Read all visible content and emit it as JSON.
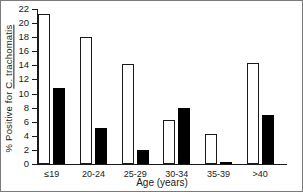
{
  "chart_data": {
    "type": "bar",
    "title": "",
    "xlabel": "Age (years)",
    "ylabel": "% Positive for C. trachomatis",
    "ylabel_plain": "% Positive for ",
    "ylabel_italic": "C. trachomatis",
    "categories": [
      "≤19",
      "20-24",
      "25-29",
      "30-34",
      "35-39",
      ">40"
    ],
    "series": [
      {
        "name": "open",
        "style": "open",
        "color": "#ffffff",
        "edge_color": "#000000",
        "values": [
          21.3,
          18.0,
          14.2,
          6.2,
          4.2,
          14.3
        ]
      },
      {
        "name": "filled",
        "style": "filled",
        "color": "#000000",
        "edge_color": "#000000",
        "values": [
          10.8,
          5.1,
          2.0,
          8.0,
          0.3,
          7.0
        ]
      }
    ],
    "ylim": [
      0,
      22
    ],
    "yticks": [
      0,
      2,
      4,
      6,
      8,
      10,
      12,
      14,
      16,
      18,
      20,
      22
    ],
    "ytick_labels": [
      "0",
      "2",
      "4",
      "6",
      "8",
      "10",
      "12",
      "14",
      "16",
      "18",
      "20",
      "22"
    ],
    "grid": false,
    "legend": "none"
  }
}
